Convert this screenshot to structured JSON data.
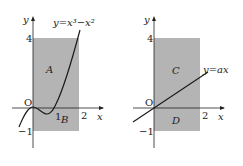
{
  "left_plot": {
    "y_axis_label": "y",
    "x_axis_label": "x",
    "origin_label": "O",
    "tick_y_top": "4",
    "tick_y_bottom": "−1",
    "tick_x_1": "1",
    "tick_x_2": "2",
    "curve_label": "y=x³−x²",
    "region_upper": "A",
    "region_lower": "B"
  },
  "right_plot": {
    "y_axis_label": "y",
    "x_axis_label": "x",
    "origin_label": "O",
    "tick_y_top": "4",
    "tick_y_bottom": "−1",
    "tick_x_2": "2",
    "line_label": "y=ax",
    "region_upper": "C",
    "region_lower": "D"
  },
  "colors": {
    "region_fill": "#b4b4b4",
    "axis": "#222222",
    "curve": "#1a1a1a"
  }
}
